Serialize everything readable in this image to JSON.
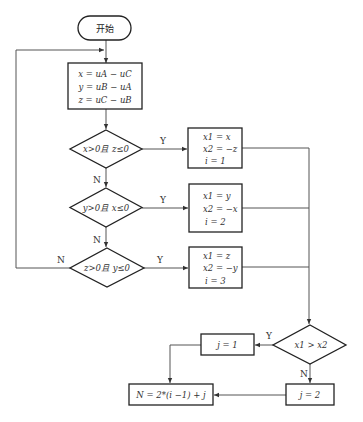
{
  "start": {
    "label": "开始"
  },
  "init_box": {
    "lines": [
      "x = uA − uC",
      "y = uB − uA",
      "z = uC − uB"
    ]
  },
  "decisions": [
    {
      "label": "x>0且 z≤0",
      "yes": "Y",
      "no": "N"
    },
    {
      "label": "y>0且 x≤0",
      "yes": "Y",
      "no": "N"
    },
    {
      "label": "z>0且 y≤0",
      "yes": "Y",
      "no": "N"
    }
  ],
  "assign_boxes": [
    {
      "lines": [
        "x1 = x",
        "x2 = −z",
        "i = 1"
      ]
    },
    {
      "lines": [
        "x1 = y",
        "x2 = −x",
        "i = 2"
      ]
    },
    {
      "lines": [
        "x1 = z",
        "x2 = −y",
        "i = 3"
      ]
    }
  ],
  "compare": {
    "label": "x1 > x2",
    "yes": "Y",
    "no": "N"
  },
  "j1_box": {
    "label": "j = 1"
  },
  "j2_box": {
    "label": "j = 2"
  },
  "result_box": {
    "label": "N = 2*(i −1) + j"
  }
}
